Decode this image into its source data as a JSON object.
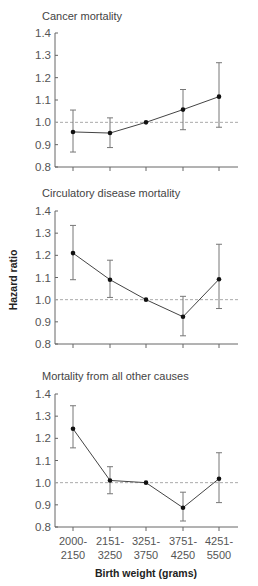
{
  "chart_data": [
    {
      "type": "line",
      "title": "Cancer mortality",
      "categories": [
        "2000-2150",
        "2151-3250",
        "3251-3750",
        "3751-4250",
        "4251-5500"
      ],
      "series": [
        {
          "name": "Hazard ratio",
          "values": [
            0.957,
            0.952,
            1.0,
            1.057,
            1.115
          ],
          "ci_upper": [
            1.055,
            1.02,
            1.0,
            1.147,
            1.267
          ],
          "ci_lower": [
            0.867,
            0.887,
            1.0,
            0.967,
            0.978
          ]
        }
      ],
      "reference_line": 1.0,
      "ylim": [
        0.8,
        1.4
      ],
      "yticks": [
        "1.4",
        "1.3",
        "1.2",
        "1.1",
        "1.0",
        "0.9",
        "0.8"
      ]
    },
    {
      "type": "line",
      "title": "Circulatory disease mortality",
      "categories": [
        "2000-2150",
        "2151-3250",
        "3251-3750",
        "3751-4250",
        "4251-5500"
      ],
      "series": [
        {
          "name": "Hazard ratio",
          "values": [
            1.21,
            1.09,
            1.0,
            0.923,
            1.092
          ],
          "ci_upper": [
            1.335,
            1.178,
            1.0,
            1.015,
            1.25
          ],
          "ci_lower": [
            1.09,
            1.01,
            1.0,
            0.837,
            0.96
          ]
        }
      ],
      "reference_line": 1.0,
      "ylim": [
        0.8,
        1.4
      ],
      "yticks": [
        "1.4",
        "1.3",
        "1.2",
        "1.1",
        "1.0",
        "0.9",
        "0.8"
      ]
    },
    {
      "type": "line",
      "title": "Mortality from all other causes",
      "categories": [
        "2000-2150",
        "2151-3250",
        "3251-3750",
        "3751-4250",
        "4251-5500"
      ],
      "series": [
        {
          "name": "Hazard ratio",
          "values": [
            1.243,
            1.01,
            1.0,
            0.887,
            1.018
          ],
          "ci_upper": [
            1.347,
            1.072,
            1.0,
            0.957,
            1.135
          ],
          "ci_lower": [
            1.157,
            0.95,
            1.0,
            0.827,
            0.91
          ]
        }
      ],
      "reference_line": 1.0,
      "ylim": [
        0.8,
        1.4
      ],
      "yticks": [
        "1.4",
        "1.3",
        "1.2",
        "1.1",
        "1.0",
        "0.9",
        "0.8"
      ]
    }
  ],
  "ylabel": "Hazard ratio",
  "xlabel": "Birth weight (grams)",
  "xtick_lines": [
    [
      "2000-",
      "2150"
    ],
    [
      "2151-",
      "3250"
    ],
    [
      "3251-",
      "3750"
    ],
    [
      "3751-",
      "4250"
    ],
    [
      "4251-",
      "5500"
    ]
  ],
  "colors": {
    "line": "#444444",
    "marker": "#111111",
    "errorbar": "#777777",
    "reference": "#aaaaaa",
    "axis": "#666666"
  }
}
